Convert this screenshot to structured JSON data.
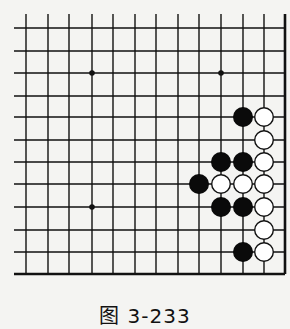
{
  "diagram": {
    "type": "go-board-fragment",
    "caption": "图 3-233",
    "grid": {
      "columns": 13,
      "rows": 12,
      "x_positions": [
        26,
        48,
        69,
        92,
        113,
        135,
        156,
        178,
        199,
        221,
        243,
        264,
        285
      ],
      "y_positions": [
        28,
        51,
        73,
        96,
        117,
        140,
        162,
        184,
        207,
        230,
        252,
        274
      ],
      "line_left_extent": 14,
      "line_top_extent": 14,
      "right_edge_thick": true,
      "bottom_edge_thick": true
    },
    "star_points": [
      {
        "col": 3,
        "row": 2
      },
      {
        "col": 9,
        "row": 2
      },
      {
        "col": 3,
        "row": 8
      }
    ],
    "stones": [
      {
        "color": "black",
        "col": 10,
        "row": 4
      },
      {
        "color": "white",
        "col": 11,
        "row": 4
      },
      {
        "color": "white",
        "col": 11,
        "row": 5
      },
      {
        "color": "black",
        "col": 9,
        "row": 6
      },
      {
        "color": "black",
        "col": 10,
        "row": 6
      },
      {
        "color": "white",
        "col": 11,
        "row": 6
      },
      {
        "color": "black",
        "col": 8,
        "row": 7
      },
      {
        "color": "white",
        "col": 9,
        "row": 7
      },
      {
        "color": "white",
        "col": 10,
        "row": 7
      },
      {
        "color": "white",
        "col": 11,
        "row": 7
      },
      {
        "color": "black",
        "col": 9,
        "row": 8
      },
      {
        "color": "black",
        "col": 10,
        "row": 8
      },
      {
        "color": "white",
        "col": 11,
        "row": 8
      },
      {
        "color": "white",
        "col": 11,
        "row": 9
      },
      {
        "color": "black",
        "col": 10,
        "row": 10
      },
      {
        "color": "white",
        "col": 11,
        "row": 10
      }
    ],
    "colors": {
      "line": "#111111",
      "black_stone": "#0a0a0a",
      "white_stone_fill": "#ffffff",
      "white_stone_stroke": "#111111",
      "background": "#f4f4f2"
    }
  }
}
